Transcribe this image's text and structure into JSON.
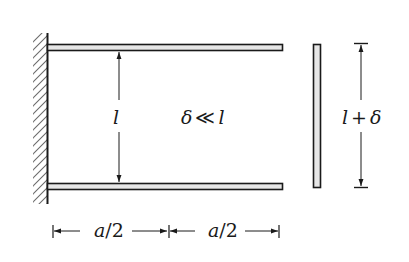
{
  "diagram": {
    "title": "",
    "colors": {
      "ink": "#1a1a1a",
      "beam_fill": "#e6e6e6",
      "hatch": "#555555",
      "background": "#ffffff"
    },
    "components": {
      "wall": {
        "type": "fixed-support",
        "hatched": true
      },
      "top_beam": {
        "type": "cantilever",
        "length": "a"
      },
      "bottom_beam": {
        "type": "cantilever",
        "length": "a"
      },
      "plate": {
        "type": "vertical-bar",
        "length": "l + δ"
      }
    },
    "labels": {
      "gap": "l",
      "relation_delta": "δ",
      "relation_symbol": "≪",
      "relation_l": "l",
      "plate_length_l": "l",
      "plate_length_plus": "+",
      "plate_length_delta": "δ",
      "dim_left_a": "a",
      "dim_left_rest": "/2",
      "dim_right_a": "a",
      "dim_right_rest": "/2"
    },
    "relations": [
      "δ ≪ l"
    ],
    "dimensions": [
      {
        "label": "a/2",
        "span": "wall to midpoint"
      },
      {
        "label": "a/2",
        "span": "midpoint to beam tip"
      },
      {
        "label": "l",
        "span": "distance between beams"
      },
      {
        "label": "l + δ",
        "span": "length of vertical plate"
      }
    ]
  }
}
